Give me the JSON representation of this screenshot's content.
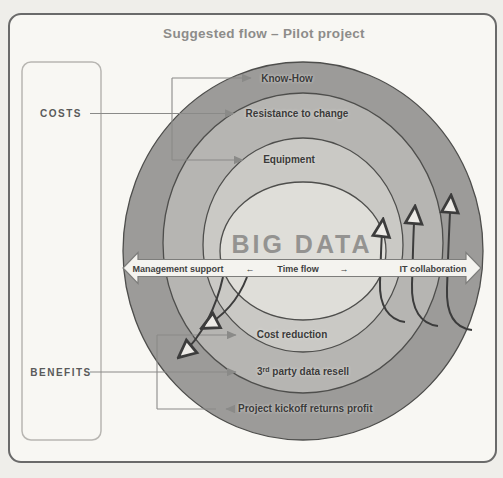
{
  "title": "Suggested flow – Pilot project",
  "left_panel": {
    "costs": "COSTS",
    "benefits": "BENEFITS"
  },
  "center": {
    "label": "BIG DATA"
  },
  "banner": {
    "left": "Management support",
    "back_arrow": "←",
    "center": "Time flow",
    "forward_arrow": "→",
    "right": "IT collaboration"
  },
  "rings": {
    "know_how": "Know-How",
    "resistance": "Resistance to change",
    "equipment": "Equipment",
    "cost_reduction": "Cost reduction",
    "third_party": {
      "base": "3",
      "sup": "rd",
      "rest": " party data resell"
    },
    "kickoff": "Project kickoff returns profit"
  },
  "colors": {
    "paper": "#f8f7f3",
    "frame_border": "#6a6a6a",
    "ring_outer": "#9c9b99",
    "ring_2": "#b6b5b2",
    "ring_3": "#cac9c5",
    "ring_center": "#dfded9",
    "ring_stroke": "#4e4e4c",
    "banner_fill": "#f4f3ef",
    "banner_stroke": "#7d7d7b",
    "arrow_dark": "#3c3c3c",
    "arrow_open_fill": "#edebe7",
    "pointer_gray": "#8a8a88",
    "panel_border": "#b8b6b2"
  }
}
